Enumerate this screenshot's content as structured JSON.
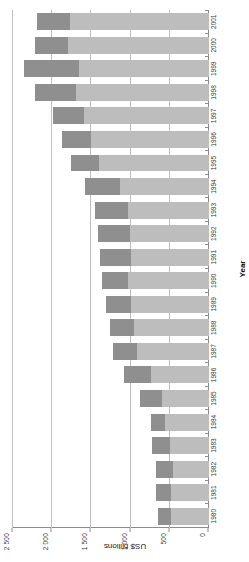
{
  "chart_data": {
    "type": "bar",
    "subtype": "stacked-horizontal",
    "title": "",
    "xlabel": "Year",
    "ylabel": "US$ billions",
    "ylim": [
      0,
      2500
    ],
    "grid": true,
    "legend": "none",
    "orientation": "rotated-90-ccw",
    "categories": [
      "1980",
      "1981",
      "1982",
      "1983",
      "1984",
      "1985",
      "1986",
      "1987",
      "1988",
      "1989",
      "1990",
      "1991",
      "1992",
      "1993",
      "1994",
      "1995",
      "1996",
      "1997",
      "1998",
      "1999",
      "2000",
      "2001"
    ],
    "tick_labels": [
      "0",
      "500",
      "1 000",
      "1 500",
      "2 000",
      "2 500"
    ],
    "tick_values": [
      0,
      500,
      1000,
      1500,
      2000,
      2500
    ],
    "series": [
      {
        "name": "base-segment",
        "color": "#bdbdbd",
        "values": [
          490,
          490,
          460,
          500,
          560,
          600,
          740,
          920,
          960,
          990,
          1030,
          1000,
          1010,
          1030,
          1130,
          1400,
          1510,
          1600,
          1700,
          1660,
          1800,
          1770
        ]
      },
      {
        "name": "top-segment",
        "color": "#8f8f8f",
        "values": [
          160,
          190,
          215,
          230,
          185,
          275,
          340,
          300,
          300,
          320,
          330,
          390,
          400,
          430,
          450,
          360,
          370,
          390,
          520,
          700,
          420,
          430
        ]
      }
    ],
    "totals": [
      650,
      680,
      675,
      730,
      745,
      875,
      1080,
      1220,
      1260,
      1310,
      1360,
      1390,
      1410,
      1460,
      1580,
      1760,
      1880,
      1990,
      2220,
      2360,
      2220,
      2200
    ]
  },
  "axes": {
    "value_axis_title": "US$ billions",
    "category_axis_title": "Year"
  },
  "colors": {
    "base_segment": "#bdbdbd",
    "top_segment": "#8f8f8f",
    "grid": "#bfbfbf",
    "axis": "#8c8c8c",
    "text": "#3a3a3a",
    "background": "#ffffff"
  }
}
